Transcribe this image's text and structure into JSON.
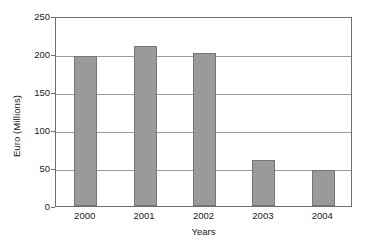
{
  "chart_data": {
    "type": "bar",
    "title": "",
    "categories": [
      "2000",
      "2001",
      "2002",
      "2003",
      "2004"
    ],
    "values": [
      197,
      210,
      201,
      60,
      48
    ],
    "xlabel": "Years",
    "ylabel": "Euro (Millions)",
    "ylim": [
      0,
      250
    ],
    "yticks": [
      0,
      50,
      100,
      150,
      200,
      250
    ],
    "ytick_labels": [
      "0",
      "50",
      "100",
      "150",
      "200",
      "250"
    ],
    "grid": "horizontal",
    "legend": "none",
    "series": [
      {
        "name": "Euro (Millions)",
        "values": [
          197,
          210,
          201,
          60,
          48
        ]
      }
    ],
    "colors": {
      "bar_fill": "#9a9a9a",
      "bar_border": "#767676",
      "gridline": "#9b9b9b",
      "axis": "#6e6e6e",
      "background": "#ffffff",
      "text": "#1a1a1a"
    }
  }
}
